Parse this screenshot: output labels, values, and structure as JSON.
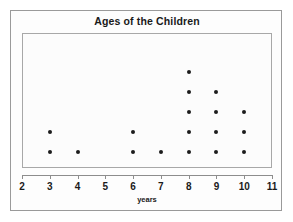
{
  "chart_data": {
    "type": "scatter",
    "title": "Ages of the Children",
    "xlabel": "years",
    "ylabel": "",
    "xlim": [
      2,
      11
    ],
    "xticks": [
      2,
      3,
      4,
      5,
      6,
      7,
      8,
      9,
      10,
      11
    ],
    "xtick_labels": [
      "2",
      "3",
      "4",
      "5",
      "6",
      "7",
      "8",
      "9",
      "10",
      "11"
    ],
    "grid": false,
    "legend": "none",
    "plot_style": "dot-plot",
    "categories": [
      3,
      4,
      5,
      6,
      7,
      8,
      9,
      10
    ],
    "values": [
      2,
      1,
      0,
      2,
      1,
      5,
      4,
      3
    ],
    "dot_color": "#1c1c1c",
    "frame_color": "#9a9a9a",
    "plot_border_color": "#a8a8a8",
    "background_color": "#ffffff",
    "points": [
      {
        "x": 3,
        "stack": 1
      },
      {
        "x": 3,
        "stack": 2
      },
      {
        "x": 4,
        "stack": 1
      },
      {
        "x": 6,
        "stack": 1
      },
      {
        "x": 6,
        "stack": 2
      },
      {
        "x": 7,
        "stack": 1
      },
      {
        "x": 8,
        "stack": 1
      },
      {
        "x": 8,
        "stack": 2
      },
      {
        "x": 8,
        "stack": 3
      },
      {
        "x": 8,
        "stack": 4
      },
      {
        "x": 8,
        "stack": 5
      },
      {
        "x": 9,
        "stack": 1
      },
      {
        "x": 9,
        "stack": 2
      },
      {
        "x": 9,
        "stack": 3
      },
      {
        "x": 9,
        "stack": 4
      },
      {
        "x": 10,
        "stack": 1
      },
      {
        "x": 10,
        "stack": 2
      },
      {
        "x": 10,
        "stack": 3
      }
    ]
  }
}
